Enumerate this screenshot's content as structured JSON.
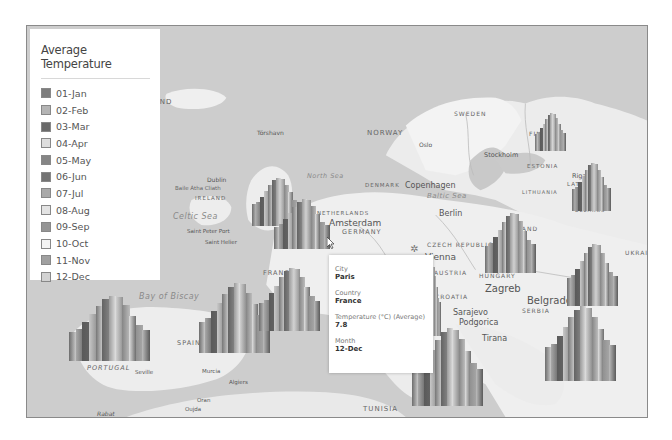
{
  "legend": {
    "title": "Average Temperature",
    "items": [
      {
        "label": "01-Jan",
        "color": "#7d7d7d"
      },
      {
        "label": "02-Feb",
        "color": "#b4b4b4"
      },
      {
        "label": "03-Mar",
        "color": "#6a6a6a"
      },
      {
        "label": "04-Apr",
        "color": "#dedede"
      },
      {
        "label": "05-May",
        "color": "#858585"
      },
      {
        "label": "06-Jun",
        "color": "#737373"
      },
      {
        "label": "07-Jul",
        "color": "#a9a9a9"
      },
      {
        "label": "08-Aug",
        "color": "#e3e3e3"
      },
      {
        "label": "09-Sep",
        "color": "#959595"
      },
      {
        "label": "10-Oct",
        "color": "#f4f4f4"
      },
      {
        "label": "11-Nov",
        "color": "#a0a0a0"
      },
      {
        "label": "12-Dec",
        "color": "#d2d2d2"
      }
    ]
  },
  "tooltip": {
    "city_label": "City",
    "city_value": "Paris",
    "country_label": "Country",
    "country_value": "France",
    "temp_label": "Temperature (°C) (Average)",
    "temp_value": "7.8",
    "month_label": "Month",
    "month_value": "12-Dec"
  },
  "map_labels": {
    "iceland": "LAND",
    "tórshavn": "Tórshavn",
    "norway": "NORWAY",
    "oslo": "Oslo",
    "sweden": "SWEDEN",
    "stockholm": "Stockholm",
    "finland": "FINLAND",
    "helsinki": "Helsinki",
    "tallinn": "Tallinn",
    "estonia": "ESTONIA",
    "riga": "Riga",
    "latvia": "LATVIA",
    "lithuania": "LITHUANIA",
    "belarus": "BELARUS",
    "north_sea": "North Sea",
    "denmark": "DENMARK",
    "copenhagen": "Copenhagen",
    "baltic_sea": "Baltic Sea",
    "uk": "UNITED KINGDOM",
    "london": "London",
    "dublin": "Dublin",
    "baile_atha_cliath": "Baile Átha Cliath",
    "ireland": "IRELAND",
    "celtic_sea": "Celtic Sea",
    "saint_peter_port": "Saint Peter Port",
    "saint_helier": "Saint Helier",
    "netherlands": "NETHERLANDS",
    "amsterdam": "Amsterdam",
    "germany": "GERMANY",
    "belgium": "BELGIUM",
    "berlin": "Berlin",
    "poland": "POLAND",
    "czech": "CZECH REPUBLIC",
    "vienna": "Vienna",
    "austria": "AUSTRIA",
    "hungary": "HUNGARY",
    "ukraine": "UKRAINE",
    "romania": "ROMANIA",
    "zagreb": "Zagreb",
    "croatia": "CROATIA",
    "belgrade": "Belgrade",
    "serbia": "SERBIA",
    "sarajevo": "Sarajevo",
    "podgorica": "Podgorica",
    "tirana": "Tirana",
    "skopje": "Skopje",
    "france": "FRANCE",
    "bay_of_biscay": "Bay of Biscay",
    "spain": "SPAIN",
    "portugal": "PORTUGAL",
    "seville": "Seville",
    "murcia": "Murcia",
    "algiers": "Algiers",
    "oran": "Oran",
    "oujda": "Oujda",
    "rabat": "Rabat",
    "tunisia": "TUNISIA",
    "rome": "Rome",
    "ionian_sea": "Ionian Sea",
    "izmir": "İzmir"
  },
  "chart_data": {
    "type": "bar",
    "title": "Average Temperature",
    "categories": [
      "01-Jan",
      "02-Feb",
      "03-Mar",
      "04-Apr",
      "05-May",
      "06-Jun",
      "07-Jul",
      "08-Aug",
      "09-Sep",
      "10-Oct",
      "11-Nov",
      "12-Dec"
    ],
    "series": [
      {
        "name": "Paris, France",
        "values": [
          null,
          null,
          null,
          null,
          null,
          null,
          null,
          null,
          null,
          null,
          null,
          7.8
        ]
      }
    ],
    "note": "3D column clusters per city on a map of Europe; only Paris Dec value (7.8 °C) is labeled."
  }
}
